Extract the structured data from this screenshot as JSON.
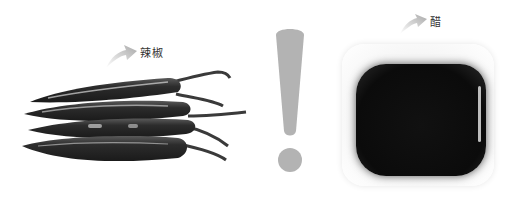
{
  "left_item": {
    "label": "辣椒",
    "subject": "chili-peppers"
  },
  "right_item": {
    "label": "醋",
    "subject": "vinegar-dish"
  },
  "center_symbol": "!",
  "colors": {
    "exclamation": "#b3b3b3",
    "pepper": "#2a2a2a",
    "vinegar": "#0c0c0c",
    "arrow": "#bdbdbd"
  }
}
